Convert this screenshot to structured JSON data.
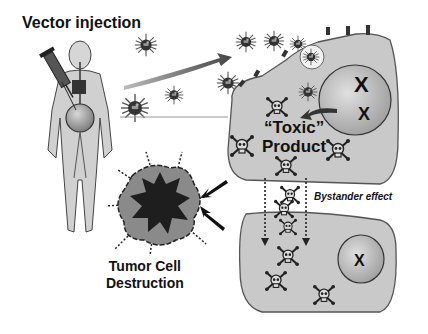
{
  "labels": {
    "vector_injection": "Vector injection",
    "toxic_line1": "“Toxic”",
    "toxic_line2": "Product",
    "bystander_effect": "Bystander effect",
    "tumor_line1": "Tumor Cell",
    "tumor_line2": "Destruction"
  },
  "elements": {
    "human_figure": "human body with syringe injecting vector",
    "syringe": "syringe",
    "virus_particles": 7,
    "transduced_cell": "upper cell with receptors, endosome, nucleus with chromosomes",
    "neighbor_cell": "lower cell with nucleus",
    "skull_icons_upper": 5,
    "skull_icons_transit": 3,
    "skull_icons_lower": 3,
    "tumor_burst": "destroyed tumor cell",
    "arrows": [
      "curved arrow to cell",
      "arrow from nucleus",
      "two arrows to tumor",
      "two dashed downward arrows"
    ]
  },
  "colors": {
    "cell_fill": "#c9c9c9",
    "cell_stroke": "#555555",
    "nucleus_fill": "#b8b8b8",
    "tumor_outer": "#8a8a8a",
    "tumor_inner": "#1e1e1e",
    "text": "#111111"
  }
}
